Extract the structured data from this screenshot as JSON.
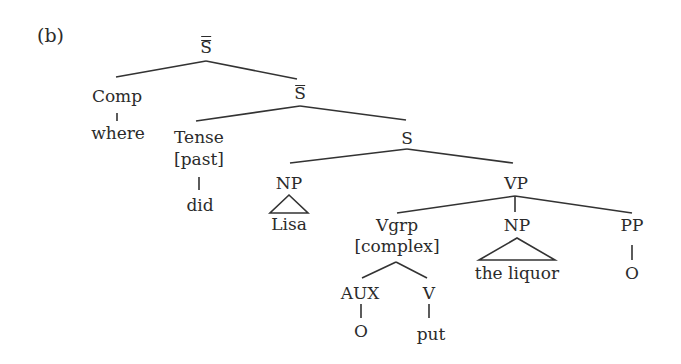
{
  "panel_label": "(b)",
  "tree": {
    "root": {
      "label": "S",
      "bars": 2
    },
    "comp": {
      "label": "Comp",
      "child": "where"
    },
    "sbar": {
      "label": "S",
      "bars": 1
    },
    "tense": {
      "label": "Tense",
      "feature": "[past]",
      "child": "did"
    },
    "s": {
      "label": "S"
    },
    "np_subject": {
      "label": "NP",
      "child": "Lisa"
    },
    "vp": {
      "label": "VP"
    },
    "vgrp": {
      "label": "Vgrp",
      "feature": "[complex]"
    },
    "aux": {
      "label": "AUX",
      "child": "O"
    },
    "v": {
      "label": "V",
      "child": "put"
    },
    "np_object": {
      "label": "NP",
      "child": "the liquor"
    },
    "pp": {
      "label": "PP",
      "child": "O"
    }
  },
  "colors": {
    "line": "#333333",
    "text": "#2b2b2b",
    "background": "#ffffff"
  }
}
